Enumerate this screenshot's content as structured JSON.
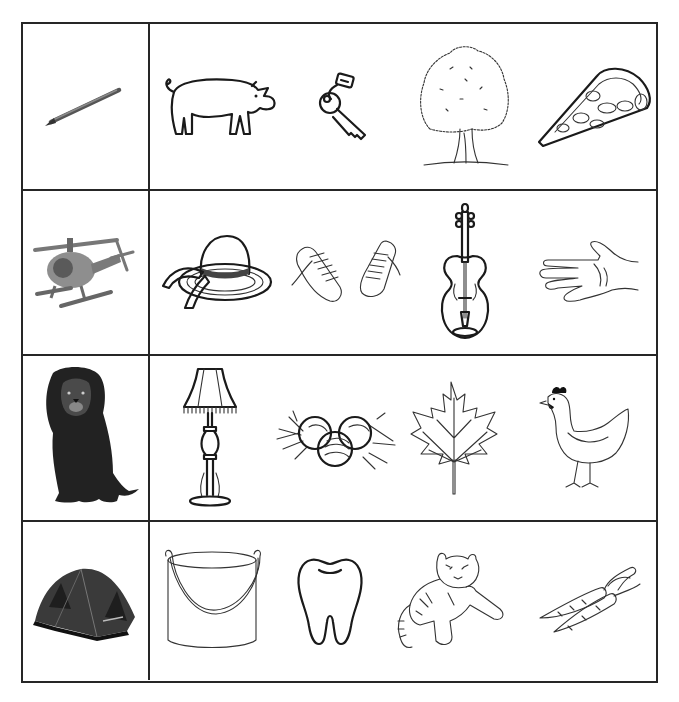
{
  "worksheet": {
    "type": "picture-matching worksheet",
    "colors": {
      "border": "#262626",
      "ink": "#1a1a1a",
      "background": "#ffffff"
    },
    "rows": [
      {
        "prompt": {
          "name": "pencil",
          "style": "photo"
        },
        "options": [
          {
            "name": "pig",
            "style": "line-drawing"
          },
          {
            "name": "keys",
            "style": "line-drawing"
          },
          {
            "name": "tree",
            "style": "line-drawing"
          },
          {
            "name": "pizza",
            "style": "line-drawing"
          }
        ]
      },
      {
        "prompt": {
          "name": "helicopter",
          "style": "photo"
        },
        "options": [
          {
            "name": "hat",
            "style": "line-drawing"
          },
          {
            "name": "sneakers",
            "style": "line-drawing"
          },
          {
            "name": "violin",
            "style": "line-drawing"
          },
          {
            "name": "hand",
            "style": "line-drawing"
          }
        ]
      },
      {
        "prompt": {
          "name": "lion",
          "style": "photo"
        },
        "options": [
          {
            "name": "lamp",
            "style": "line-drawing"
          },
          {
            "name": "eggs",
            "style": "line-drawing"
          },
          {
            "name": "leaf",
            "style": "line-drawing"
          },
          {
            "name": "hen",
            "style": "line-drawing"
          }
        ]
      },
      {
        "prompt": {
          "name": "tent",
          "style": "photo"
        },
        "options": [
          {
            "name": "bucket",
            "style": "line-drawing"
          },
          {
            "name": "tooth",
            "style": "line-drawing"
          },
          {
            "name": "tiger",
            "style": "line-drawing"
          },
          {
            "name": "carrots",
            "style": "line-drawing"
          }
        ]
      }
    ]
  }
}
